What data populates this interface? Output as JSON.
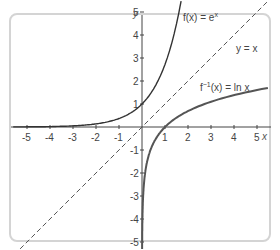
{
  "chart_data": {
    "type": "line",
    "title": "",
    "xlabel": "x",
    "ylabel": "y",
    "xlim": [
      -5.5,
      5.5
    ],
    "ylim": [
      -5.5,
      5.5
    ],
    "grid": false,
    "x_ticks": [
      -5,
      -4,
      -3,
      -2,
      -1,
      1,
      2,
      3,
      4,
      5
    ],
    "y_ticks": [
      -5,
      -4,
      -3,
      -2,
      -1,
      1,
      2,
      3,
      4,
      5
    ],
    "series": [
      {
        "name": "f(x) = e^x",
        "style": "solid",
        "color": "#333333",
        "x": [
          -5,
          -4,
          -3,
          -2,
          -1,
          0,
          0.5,
          1,
          1.5,
          1.7
        ],
        "y": [
          0.007,
          0.018,
          0.05,
          0.135,
          0.368,
          1,
          1.649,
          2.718,
          4.482,
          5.474
        ]
      },
      {
        "name": "y = x",
        "style": "dashed",
        "color": "#555555",
        "x": [
          -5.5,
          5.5
        ],
        "y": [
          -5.5,
          5.5
        ]
      },
      {
        "name": "f^-1(x) = ln x",
        "style": "solid",
        "color": "#555555",
        "x": [
          0.005,
          0.018,
          0.05,
          0.135,
          0.368,
          1,
          2,
          3,
          4,
          5,
          5.5
        ],
        "y": [
          -5.3,
          -4,
          -3,
          -2,
          -1,
          0,
          0.693,
          1.099,
          1.386,
          1.609,
          1.705
        ]
      }
    ],
    "annotations": [
      {
        "text": "f(x) = e^x",
        "near": [
          1.8,
          4.9
        ]
      },
      {
        "text": "y = x",
        "near": [
          4.0,
          3.4
        ]
      },
      {
        "text": "f^-1(x) = ln x",
        "near": [
          2.5,
          1.7
        ]
      }
    ]
  },
  "labels": {
    "x_axis": "x",
    "y_axis": "y",
    "exp_fn": "f(x) = e",
    "exp_sup": "x",
    "identity": "y = x",
    "ln_fn_a": "f",
    "ln_sup": "−1",
    "ln_fn_b": "(x) = ln x"
  },
  "ticks": {
    "x": [
      "-5",
      "-4",
      "-3",
      "-2",
      "-1",
      "1",
      "2",
      "3",
      "4",
      "5"
    ],
    "y": [
      "5",
      "4",
      "3",
      "2",
      "1",
      "-1",
      "-2",
      "-3",
      "-4",
      "-5"
    ]
  }
}
